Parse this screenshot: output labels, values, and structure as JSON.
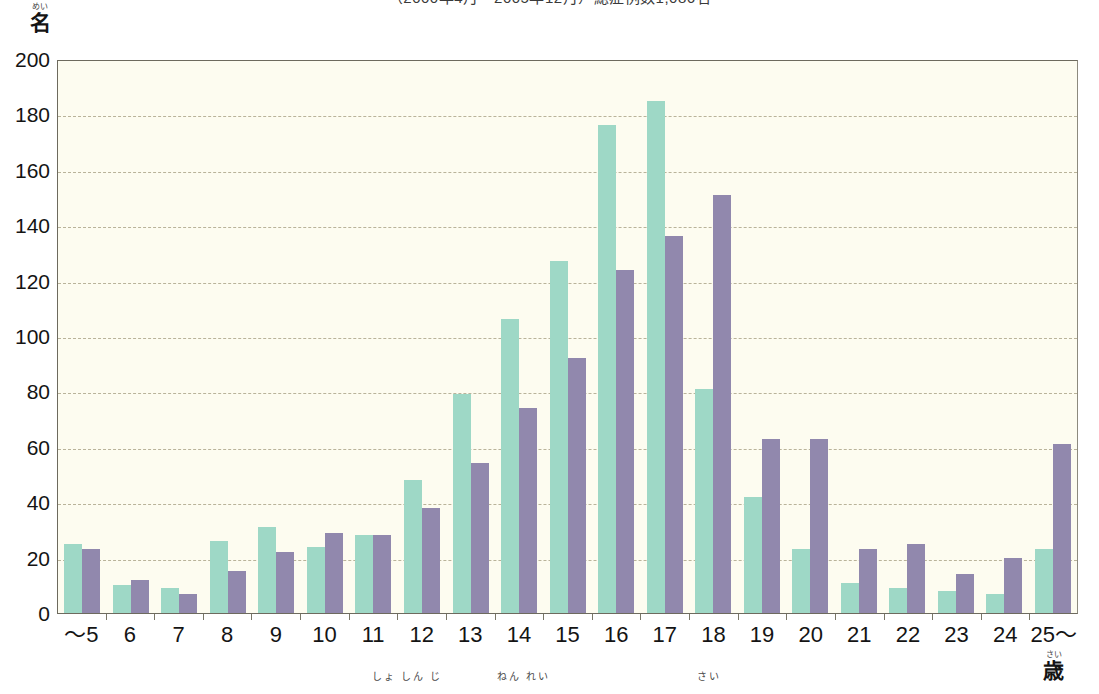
{
  "chart_data": {
    "type": "bar",
    "title": "（2000年4月～2005年12月）総症例数1,086名",
    "xlabel": "初診時年齢（歳）",
    "ylabel": "名",
    "ylim": [
      0,
      200
    ],
    "ytick_step": 20,
    "ytick_labels": [
      "200",
      "180",
      "160",
      "140",
      "120",
      "100",
      "80",
      "60",
      "40",
      "20",
      "0"
    ],
    "grid": true,
    "legend_position": "none",
    "categories": [
      "～5",
      "6",
      "7",
      "8",
      "9",
      "10",
      "11",
      "12",
      "13",
      "14",
      "15",
      "16",
      "17",
      "18",
      "19",
      "20",
      "21",
      "22",
      "23",
      "24",
      "25～"
    ],
    "series": [
      {
        "name": "series-a",
        "color": "#9ed8c6",
        "values": [
          25,
          10,
          9,
          26,
          31,
          24,
          28,
          48,
          79,
          106,
          127,
          176,
          185,
          81,
          42,
          23,
          11,
          9,
          8,
          7,
          23
        ]
      },
      {
        "name": "series-b",
        "color": "#9188ad",
        "values": [
          23,
          12,
          7,
          15,
          22,
          29,
          28,
          38,
          54,
          74,
          92,
          124,
          136,
          151,
          63,
          63,
          23,
          25,
          14,
          20,
          61
        ]
      }
    ]
  },
  "axis": {
    "y_unit_kanji": "名",
    "y_unit_ruby": "めい",
    "x_last_suffix_kanji": "歳",
    "x_last_suffix_ruby": "さい"
  },
  "caption_ruby": {
    "chunk1": "しょ しん じ",
    "chunk2": "ねん れい",
    "chunk3": "さい"
  },
  "colors": {
    "series_a": "#9ed8c6",
    "series_b": "#9188ad",
    "plot_background": "#fdfcf0",
    "grid": "#b9b39a",
    "axis": "#6d6a5e",
    "text": "#141414"
  }
}
